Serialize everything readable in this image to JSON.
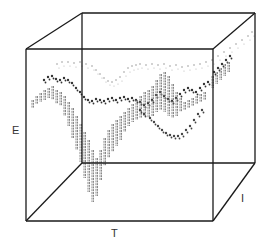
{
  "chart_data": {
    "type": "scatter",
    "subtype": "3d-box-plot",
    "title": "",
    "axes": {
      "x": "T",
      "y": "E",
      "z": "I"
    },
    "grid": false,
    "legend": null,
    "box": {
      "front": {
        "left": 26,
        "right": 213,
        "top": 49,
        "bottom": 221
      },
      "back": {
        "left": 82,
        "right": 255,
        "top": 13,
        "bottom": 163
      },
      "stroke": "#1a1a1a"
    },
    "series": [
      {
        "name": "upper-band",
        "style": "light-dots",
        "color": "#9a9a9a",
        "points": [
          [
            57,
            64
          ],
          [
            62,
            62
          ],
          [
            68,
            62
          ],
          [
            74,
            63
          ],
          [
            80,
            62
          ],
          [
            86,
            64
          ],
          [
            92,
            66
          ],
          [
            96,
            70
          ],
          [
            100,
            74
          ],
          [
            104,
            78
          ],
          [
            108,
            81
          ],
          [
            112,
            82
          ],
          [
            116,
            80
          ],
          [
            120,
            77
          ],
          [
            124,
            72
          ],
          [
            128,
            68
          ],
          [
            132,
            66
          ],
          [
            136,
            65
          ],
          [
            140,
            64
          ],
          [
            146,
            65
          ],
          [
            152,
            64
          ],
          [
            158,
            65
          ],
          [
            164,
            64
          ],
          [
            170,
            66
          ],
          [
            176,
            65
          ],
          [
            182,
            67
          ],
          [
            188,
            66
          ],
          [
            194,
            65
          ],
          [
            200,
            64
          ],
          [
            206,
            62
          ],
          [
            212,
            60
          ],
          [
            218,
            56
          ],
          [
            224,
            52
          ],
          [
            230,
            48
          ],
          [
            236,
            44
          ],
          [
            242,
            40
          ],
          [
            248,
            36
          ],
          [
            252,
            32
          ]
        ]
      },
      {
        "name": "mid-band",
        "style": "dark-dots",
        "color": "#333333",
        "points": [
          [
            44,
            80
          ],
          [
            48,
            77
          ],
          [
            52,
            76
          ],
          [
            56,
            79
          ],
          [
            60,
            80
          ],
          [
            64,
            78
          ],
          [
            68,
            80
          ],
          [
            72,
            83
          ],
          [
            76,
            88
          ],
          [
            80,
            92
          ],
          [
            84,
            97
          ],
          [
            88,
            100
          ],
          [
            92,
            101
          ],
          [
            96,
            99
          ],
          [
            100,
            100
          ],
          [
            104,
            101
          ],
          [
            108,
            99
          ],
          [
            112,
            98
          ],
          [
            116,
            100
          ],
          [
            120,
            98
          ],
          [
            124,
            97
          ],
          [
            128,
            99
          ],
          [
            132,
            98
          ],
          [
            136,
            100
          ],
          [
            140,
            102
          ],
          [
            144,
            105
          ],
          [
            148,
            103
          ],
          [
            152,
            100
          ],
          [
            156,
            95
          ],
          [
            160,
            92
          ],
          [
            164,
            96
          ],
          [
            168,
            99
          ],
          [
            172,
            101
          ],
          [
            176,
            98
          ],
          [
            180,
            94
          ],
          [
            184,
            90
          ],
          [
            188,
            88
          ],
          [
            192,
            90
          ],
          [
            196,
            92
          ],
          [
            200,
            88
          ],
          [
            204,
            84
          ],
          [
            208,
            82
          ],
          [
            214,
            72
          ],
          [
            218,
            68
          ],
          [
            222,
            64
          ],
          [
            226,
            60
          ],
          [
            230,
            56
          ]
        ]
      },
      {
        "name": "bar-series",
        "style": "vertical-bars",
        "color": "#7a7a7a",
        "bars": [
          [
            32,
            100,
            108
          ],
          [
            36,
            96,
            104
          ],
          [
            40,
            93,
            102
          ],
          [
            44,
            90,
            100
          ],
          [
            48,
            88,
            98
          ],
          [
            52,
            86,
            100
          ],
          [
            56,
            90,
            104
          ],
          [
            60,
            92,
            106
          ],
          [
            64,
            96,
            116
          ],
          [
            68,
            102,
            126
          ],
          [
            72,
            108,
            138
          ],
          [
            76,
            116,
            150
          ],
          [
            80,
            124,
            162
          ],
          [
            84,
            132,
            178
          ],
          [
            88,
            140,
            192
          ],
          [
            92,
            150,
            202
          ],
          [
            96,
            158,
            196
          ],
          [
            100,
            150,
            180
          ],
          [
            104,
            138,
            166
          ],
          [
            108,
            130,
            158
          ],
          [
            112,
            124,
            152
          ],
          [
            116,
            120,
            146
          ],
          [
            120,
            116,
            140
          ],
          [
            124,
            112,
            132
          ],
          [
            128,
            108,
            126
          ],
          [
            132,
            104,
            122
          ],
          [
            136,
            100,
            120
          ],
          [
            140,
            96,
            118
          ],
          [
            144,
            92,
            116
          ],
          [
            148,
            90,
            118
          ],
          [
            152,
            86,
            116
          ],
          [
            156,
            80,
            112
          ],
          [
            160,
            74,
            110
          ],
          [
            164,
            72,
            112
          ],
          [
            168,
            76,
            116
          ],
          [
            172,
            84,
            118
          ],
          [
            176,
            92,
            116
          ],
          [
            180,
            98,
            112
          ],
          [
            184,
            102,
            110
          ],
          [
            188,
            100,
            108
          ],
          [
            192,
            98,
            106
          ],
          [
            196,
            96,
            104
          ],
          [
            200,
            94,
            102
          ],
          [
            204,
            92,
            100
          ],
          [
            212,
            76,
            88
          ],
          [
            216,
            72,
            84
          ],
          [
            220,
            68,
            80
          ],
          [
            224,
            64,
            76
          ],
          [
            228,
            62,
            72
          ]
        ]
      },
      {
        "name": "lower-loop",
        "style": "dark-dots",
        "color": "#444444",
        "points": [
          [
            150,
            118
          ],
          [
            154,
            122
          ],
          [
            158,
            126
          ],
          [
            162,
            130
          ],
          [
            166,
            133
          ],
          [
            170,
            135
          ],
          [
            174,
            136
          ],
          [
            178,
            136
          ],
          [
            182,
            134
          ],
          [
            186,
            130
          ],
          [
            190,
            126
          ],
          [
            194,
            120
          ],
          [
            198,
            114
          ],
          [
            202,
            110
          ],
          [
            140,
            110
          ],
          [
            144,
            114
          ]
        ]
      }
    ]
  },
  "labels": {
    "e": "E",
    "t": "T",
    "i": "I"
  }
}
